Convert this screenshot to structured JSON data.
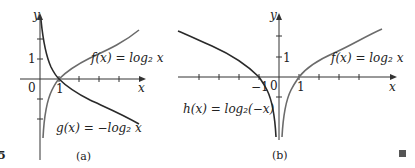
{
  "figure": {
    "number_fragment": "5",
    "end_mark": "■",
    "panels": [
      {
        "id": "a",
        "caption": "(a)",
        "axis_labels": {
          "x": "x",
          "y": "y"
        },
        "tick_labels": {
          "origin": "0",
          "x_one": "1",
          "y_one": "1"
        },
        "curves": [
          {
            "name": "f",
            "label": "f(x) = log₂ x",
            "color": "#6b6b6b"
          },
          {
            "name": "g",
            "label": "g(x) = −log₂ x",
            "color": "#2a2a2a"
          }
        ]
      },
      {
        "id": "b",
        "caption": "(b)",
        "axis_labels": {
          "x": "x",
          "y": "y"
        },
        "tick_labels": {
          "origin": "0",
          "x_one": "1",
          "x_neg_one": "−1",
          "y_one": "1"
        },
        "curves": [
          {
            "name": "f",
            "label": "f(x) = log₂ x",
            "color": "#6b6b6b"
          },
          {
            "name": "h",
            "label": "h(x) = log₂(−x)",
            "color": "#2a2a2a"
          }
        ]
      }
    ]
  }
}
